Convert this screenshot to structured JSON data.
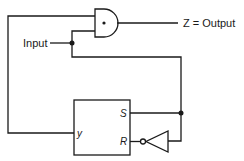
{
  "diagram": {
    "type": "logic-circuit",
    "labels": {
      "input": "Input",
      "output": "Z = Output",
      "ff_y": "y",
      "ff_s": "S",
      "ff_r": "R"
    },
    "components": [
      {
        "id": "and-gate",
        "kind": "AND gate",
        "inputs": [
          "y (feedback)",
          "Input"
        ],
        "output": "Z"
      },
      {
        "id": "sr-flip-flop",
        "kind": "SR flip-flop",
        "ports": [
          "y",
          "S",
          "R"
        ]
      },
      {
        "id": "inverter",
        "kind": "NOT gate",
        "input": "Input",
        "output": "R"
      }
    ],
    "connections": [
      "flip-flop y -> AND gate top input",
      "Input -> AND gate bottom input",
      "Input -> flip-flop S",
      "Input -> inverter -> flip-flop R",
      "AND gate output -> Z = Output"
    ],
    "colors": {
      "stroke": "#1a1a1a",
      "background": "#ffffff"
    }
  }
}
